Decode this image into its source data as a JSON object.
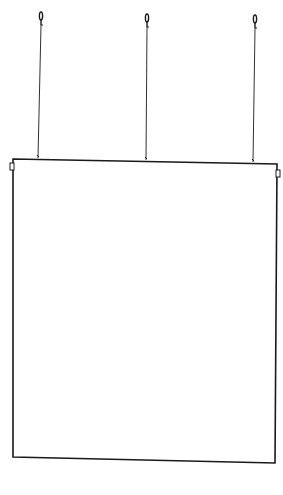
{
  "figure": {
    "colors": {
      "ink": "#1a1a1a",
      "background": "#ffffff"
    },
    "hooks": [
      {
        "x": 41,
        "top": 12,
        "bottom": 25
      },
      {
        "x": 147,
        "top": 14,
        "bottom": 27
      },
      {
        "x": 255,
        "top": 15,
        "bottom": 28
      }
    ],
    "wires": [
      {
        "x1": 41,
        "y1": 25,
        "x2": 38,
        "y2": 158
      },
      {
        "x1": 147,
        "y1": 27,
        "x2": 146,
        "y2": 160
      },
      {
        "x1": 255,
        "y1": 28,
        "x2": 253,
        "y2": 162
      }
    ],
    "panel": {
      "top_left": [
        13,
        159
      ],
      "top_right": [
        277,
        164
      ],
      "bottom_right": [
        275,
        463
      ],
      "bottom_left": [
        13,
        457
      ]
    },
    "tabs": [
      {
        "side": "left",
        "x": 10,
        "y": 163,
        "w": 4,
        "h": 7
      },
      {
        "side": "right",
        "x": 276,
        "y": 170,
        "w": 4,
        "h": 7
      }
    ]
  }
}
